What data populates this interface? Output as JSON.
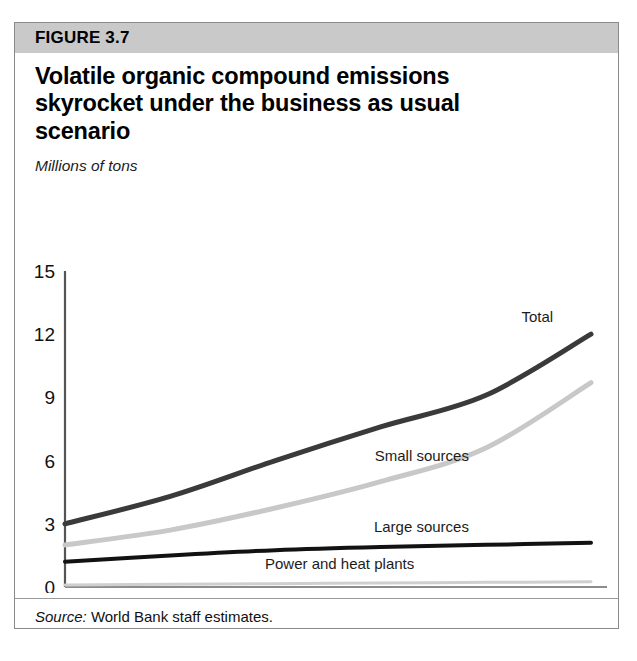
{
  "figure": {
    "number_label": "FIGURE 3.7",
    "title": "Volatile organic compound emissions skyrocket under the business as usual scenario",
    "unit_label": "Millions of tons",
    "source_prefix": "Source:",
    "source_text": "World Bank staff estimates."
  },
  "colors": {
    "header_band": "#c9c9c9",
    "border": "#8a8a8a",
    "total": "#3a3a3a",
    "small_sources": "#c8c8c8",
    "large_sources": "#121212",
    "power_heat": "#cfcfcf",
    "axis": "#555555"
  },
  "chart_data": {
    "type": "line",
    "title": "Volatile organic compound emissions skyrocket under the business as usual scenario",
    "subtitle": "Millions of tons",
    "xlabel": "",
    "ylabel": "Millions of tons",
    "x": [
      1995,
      2000,
      2005,
      2010,
      2015,
      2020
    ],
    "xticklabels": [
      "1995",
      "2000",
      "2005",
      "2010",
      "2015",
      "2020"
    ],
    "yticks": [
      0,
      3,
      6,
      9,
      12,
      15
    ],
    "yticklabels": [
      "0",
      "3",
      "6",
      "9",
      "12",
      "15"
    ],
    "xlim": [
      1995,
      2020
    ],
    "ylim": [
      0,
      15
    ],
    "grid": false,
    "legend": "inline-labels",
    "series": [
      {
        "name": "Total",
        "color": "#3a3a3a",
        "width": 5,
        "values": [
          3.0,
          4.3,
          6.0,
          7.6,
          9.1,
          12.0
        ]
      },
      {
        "name": "Small sources",
        "color": "#c8c8c8",
        "width": 5,
        "values": [
          2.0,
          2.7,
          3.75,
          5.0,
          6.6,
          9.7
        ]
      },
      {
        "name": "Large sources",
        "color": "#121212",
        "width": 4,
        "values": [
          1.2,
          1.5,
          1.75,
          1.9,
          2.0,
          2.1
        ]
      },
      {
        "name": "Power and heat plants",
        "color": "#cfcfcf",
        "width": 3,
        "values": [
          0.1,
          0.13,
          0.16,
          0.19,
          0.22,
          0.25
        ]
      }
    ],
    "annotations": [
      {
        "text": "Total",
        "series": "Total",
        "x": 2018.2,
        "y": 12.6
      },
      {
        "text": "Small sources",
        "series": "Small sources",
        "x": 2014.2,
        "y": 6.0
      },
      {
        "text": "Large sources",
        "series": "Large sources",
        "x": 2014.2,
        "y": 2.6
      },
      {
        "text": "Power and heat plants",
        "series": "Power and heat plants",
        "x": 2011.6,
        "y": 0.85
      }
    ]
  }
}
